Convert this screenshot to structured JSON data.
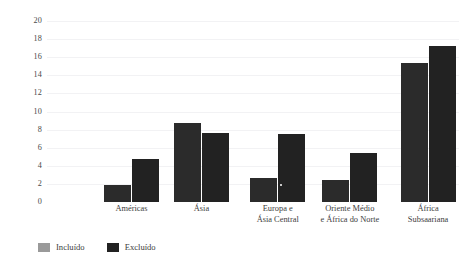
{
  "chart_data": {
    "type": "bar",
    "title": "",
    "subtitle": "",
    "xlabel": "",
    "ylabel": "",
    "ylim": [
      0,
      20
    ],
    "yticks": [
      0,
      2,
      4,
      6,
      8,
      10,
      12,
      14,
      16,
      18,
      20
    ],
    "ytick_labels": [
      "0",
      "2",
      "4",
      "6",
      "8",
      "10",
      "12",
      "14",
      "16",
      "18",
      "20"
    ],
    "grid": true,
    "legend_position": "bottom-left",
    "categories": [
      "Américas",
      "Ásia",
      "Europa e\nÁsia Central",
      "Oriente Médio\ne África do Norte",
      "África\nSubsaariana"
    ],
    "category_lines": [
      [
        "Américas"
      ],
      [
        "Ásia"
      ],
      [
        "Europa e",
        "Ásia Central"
      ],
      [
        "Oriente Médio",
        "e África do Norte"
      ],
      [
        "África",
        "Subsaariana"
      ]
    ],
    "series": [
      {
        "name": "Incluído",
        "color": "#9a9a9a",
        "bar_color": "#2b2b2b",
        "values": [
          1.9,
          8.7,
          2.6,
          2.4,
          15.4
        ]
      },
      {
        "name": "Excluído",
        "color": "#222222",
        "bar_color": "#222222",
        "values": [
          4.8,
          7.6,
          7.5,
          5.4,
          17.2
        ]
      }
    ],
    "annotations": [
      {
        "name": "marker-dot",
        "group_index": 2,
        "x_fraction": 0.55,
        "value": 1.95,
        "color": "#ffffff"
      }
    ]
  },
  "legend": {
    "items": [
      {
        "label": "Incluído",
        "swatch_color": "#9a9a9a"
      },
      {
        "label": "Excluído",
        "swatch_color": "#222222"
      }
    ]
  },
  "colors": {
    "background": "#ffffff",
    "gridline": "#f2f2f4",
    "text": "#3d3d3d",
    "included_swatch": "#9a9a9a",
    "excluded_swatch": "#222222",
    "bar_fill": "#242424"
  }
}
